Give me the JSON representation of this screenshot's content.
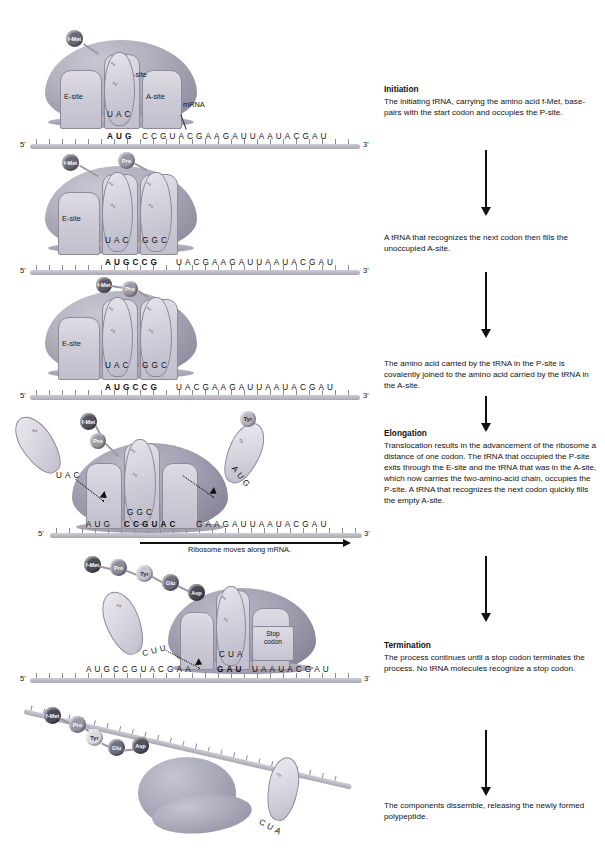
{
  "figure": {
    "mrna_sequence": "AUGCCGUACGAAGAUUAAUACGAU",
    "five_prime": "5'",
    "three_prime": "3'",
    "mrna_label": "mRNA",
    "move_label": "Ribosome moves along mRNA.",
    "stop_codon_label": "Stop codon"
  },
  "sites": {
    "e": "E-site",
    "p": "P-site",
    "a": "A-site"
  },
  "amino_acids": {
    "fmet": "f-Met",
    "pro": "Pro",
    "tyr": "Tyr",
    "glu": "Glu",
    "asp": "Asp"
  },
  "panels": [
    {
      "id": "panel-initiation",
      "seq_bold": "AUG",
      "seq_rest": "CCGUACGAAGAUUAAUACGAU",
      "anticodons": [
        "UAC"
      ],
      "amino_acids": [
        "f-Met"
      ],
      "site_labels": [
        "E-site",
        "P-site",
        "A-site"
      ]
    },
    {
      "id": "panel-a-site-filled",
      "seq_bold": "AUGCCG",
      "seq_rest": "UACGAAGAUUAAUACGAU",
      "anticodons": [
        "UAC",
        "GGC"
      ],
      "amino_acids": [
        "f-Met",
        "Pro"
      ],
      "site_labels": [
        "E-site"
      ]
    },
    {
      "id": "panel-peptide-bond",
      "seq_bold": "AUGCCG",
      "seq_rest": "UACGAAGAUUAAUACGAU",
      "anticodons": [
        "UAC",
        "GGC"
      ],
      "amino_acids": [
        "f-Met",
        "Pro"
      ],
      "site_labels": [
        "E-site"
      ]
    },
    {
      "id": "panel-elongation",
      "seq_bold": "CCGUAC",
      "anticodons": [
        "UAC",
        "GGC",
        "AUG"
      ],
      "amino_acids": [
        "f-Met",
        "Pro",
        "Tyr"
      ],
      "move_label": "Ribosome moves along mRNA."
    },
    {
      "id": "panel-termination",
      "seq_bold": "GAU",
      "anticodons": [
        "CUU",
        "CUA"
      ],
      "amino_acids": [
        "f-Met",
        "Pro",
        "Tyr",
        "Glu",
        "Asp"
      ],
      "stop_codon": "Stop codon"
    },
    {
      "id": "panel-dissemble",
      "anticodons": [
        "CUA"
      ],
      "amino_acids": [
        "f-Met",
        "Pro",
        "Tyr",
        "Glu",
        "Asp"
      ]
    }
  ],
  "steps": [
    {
      "heading": "Initiation",
      "text": "The initiating tRNA, carrying the amino acid f-Met, base-pairs with the start codon and occupies  the P-site."
    },
    {
      "heading": "",
      "text": "A tRNA that recognizes the next codon then fills the unoccupied A-site."
    },
    {
      "heading": "",
      "text": "The amino acid carried by the tRNA in the P-site is covalently joined to the amino acid carried by the tRNA in the A-site."
    },
    {
      "heading": "Elongation",
      "text": "Translocation results in the advancement of the ribosome a distance of one codon. The tRNA that occupied the P-site exits through the E-site and the tRNA that was in the A-site, which now carries the two-amino-acid chain, occupies the P-site. A tRNA that recognizes the next codon quickly fills the empty A-site."
    },
    {
      "heading": "Termination",
      "text": "The process continues until a stop codon terminates the process. No tRNA molecules recognize a stop codon."
    },
    {
      "heading": "",
      "text": "The components dissemble, releasing the newly formed polypeptide."
    }
  ],
  "colors": {
    "ribosome": "#a5a2b4",
    "site": "#d4d1dc",
    "mrna": "#bab7c4",
    "text": "#111111"
  }
}
